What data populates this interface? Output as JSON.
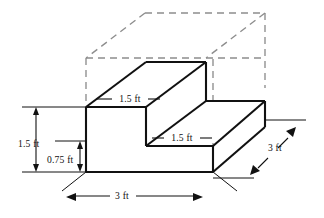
{
  "figure": {
    "type": "isometric-technical-drawing",
    "colors": {
      "solid_edge": "#111111",
      "hidden_edge": "#8d8d8d",
      "face_fill": "#ffffff",
      "background": "#ffffff",
      "text": "#111111"
    },
    "dimensions": {
      "left_total_height": "1.5 ft",
      "left_step_height": "0.75 ft",
      "upper_tread_depth": "1.5 ft",
      "lower_tread_depth": "1.5 ft",
      "front_width": "3 ft",
      "side_depth": "3 ft"
    },
    "labels": [
      {
        "id": "label-height-total",
        "text": "1.5 ft",
        "x": 36,
        "y": 147
      },
      {
        "id": "label-height-step",
        "text": "0.75 ft",
        "x": 62,
        "y": 163
      },
      {
        "id": "label-tread-upper",
        "text": "1.5 ft",
        "x": 120,
        "y": 102
      },
      {
        "id": "label-tread-lower",
        "text": "1.5 ft",
        "x": 176,
        "y": 138
      },
      {
        "id": "label-width-front",
        "text": "3 ft",
        "x": 122,
        "y": 199
      },
      {
        "id": "label-depth-side",
        "text": "3 ft",
        "x": 275,
        "y": 150
      }
    ]
  }
}
